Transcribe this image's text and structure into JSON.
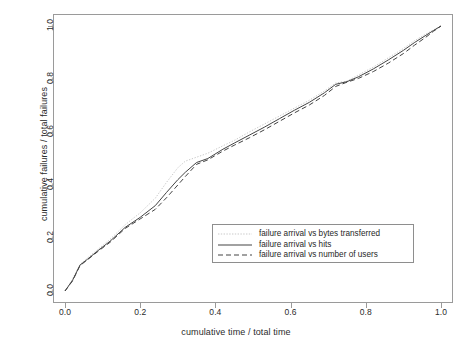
{
  "chart_data": {
    "type": "line",
    "title": "",
    "xlabel": "cumulative time / total time",
    "ylabel": "cumulative failures / total failures",
    "xlim": [
      0,
      1
    ],
    "ylim": [
      0,
      1
    ],
    "grid": false,
    "legend_position": "center-right-lower",
    "xticks": [
      "0.0",
      "0.2",
      "0.4",
      "0.6",
      "0.8",
      "1.0"
    ],
    "yticks": [
      "0.0",
      "0.2",
      "0.4",
      "0.6",
      "0.8",
      "1.0"
    ],
    "xtick_values": [
      0.0,
      0.2,
      0.4,
      0.6,
      0.8,
      1.0
    ],
    "ytick_values": [
      0.0,
      0.2,
      0.4,
      0.6,
      0.8,
      1.0
    ],
    "colors": {
      "bytes_transferred": "#c9c9c9",
      "hits": "#444444",
      "number_of_users": "#444444",
      "axis": "#9a9a9a",
      "text": "#2b2b2b",
      "background": "#ffffff"
    },
    "series": [
      {
        "name": "failure arrival vs bytes transferred",
        "style": "dotted",
        "color": "#c9c9c9",
        "x": [
          0.0,
          0.02,
          0.04,
          0.06,
          0.09,
          0.12,
          0.16,
          0.2,
          0.24,
          0.27,
          0.3,
          0.32,
          0.35,
          0.38,
          0.42,
          0.45,
          0.49,
          0.53,
          0.57,
          0.61,
          0.65,
          0.69,
          0.72,
          0.75,
          0.78,
          0.82,
          0.86,
          0.9,
          0.93,
          0.96,
          0.98,
          1.0
        ],
        "y": [
          0.0,
          0.045,
          0.1,
          0.125,
          0.16,
          0.195,
          0.25,
          0.295,
          0.35,
          0.41,
          0.465,
          0.49,
          0.505,
          0.52,
          0.548,
          0.568,
          0.6,
          0.63,
          0.66,
          0.69,
          0.72,
          0.755,
          0.785,
          0.792,
          0.815,
          0.845,
          0.88,
          0.915,
          0.945,
          0.97,
          0.985,
          1.0
        ]
      },
      {
        "name": "failure arrival vs hits",
        "style": "solid",
        "color": "#444444",
        "x": [
          0.0,
          0.02,
          0.04,
          0.06,
          0.09,
          0.12,
          0.16,
          0.2,
          0.24,
          0.27,
          0.3,
          0.32,
          0.35,
          0.38,
          0.42,
          0.45,
          0.49,
          0.53,
          0.57,
          0.61,
          0.65,
          0.69,
          0.72,
          0.75,
          0.78,
          0.82,
          0.86,
          0.9,
          0.93,
          0.96,
          0.98,
          1.0
        ],
        "y": [
          0.0,
          0.04,
          0.098,
          0.12,
          0.155,
          0.188,
          0.24,
          0.278,
          0.322,
          0.372,
          0.42,
          0.448,
          0.485,
          0.5,
          0.535,
          0.558,
          0.588,
          0.618,
          0.65,
          0.682,
          0.712,
          0.748,
          0.78,
          0.79,
          0.808,
          0.838,
          0.872,
          0.908,
          0.938,
          0.965,
          0.983,
          1.0
        ]
      },
      {
        "name": "failure arrival vs number of users",
        "style": "dashed",
        "color": "#444444",
        "x": [
          0.0,
          0.02,
          0.04,
          0.06,
          0.09,
          0.12,
          0.16,
          0.2,
          0.24,
          0.27,
          0.3,
          0.32,
          0.35,
          0.38,
          0.42,
          0.45,
          0.49,
          0.53,
          0.57,
          0.61,
          0.65,
          0.69,
          0.72,
          0.75,
          0.78,
          0.82,
          0.86,
          0.9,
          0.93,
          0.96,
          0.98,
          1.0
        ],
        "y": [
          0.0,
          0.038,
          0.096,
          0.118,
          0.152,
          0.184,
          0.236,
          0.272,
          0.308,
          0.352,
          0.4,
          0.432,
          0.478,
          0.495,
          0.528,
          0.55,
          0.578,
          0.608,
          0.64,
          0.672,
          0.702,
          0.738,
          0.772,
          0.788,
          0.802,
          0.828,
          0.86,
          0.896,
          0.928,
          0.958,
          0.98,
          1.0
        ]
      }
    ]
  },
  "legend": {
    "items": [
      {
        "label": "failure arrival vs bytes transferred"
      },
      {
        "label": "failure arrival vs hits"
      },
      {
        "label": "failure arrival vs number of users"
      }
    ]
  }
}
